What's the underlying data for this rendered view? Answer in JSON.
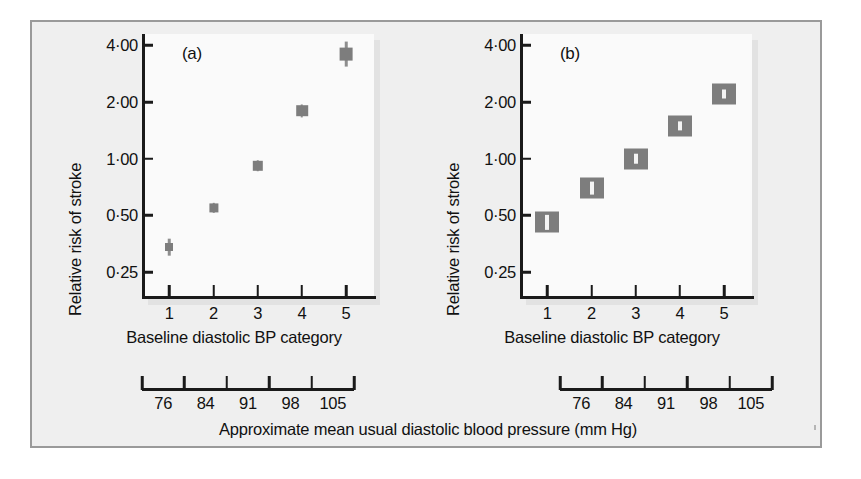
{
  "figure": {
    "caption": "Approximate mean usual diastolic blood pressure (mm Hg)",
    "frame_color": "#9a9a9a",
    "background": "#efefef",
    "marker_color": "#7d7d7d"
  },
  "panels": [
    {
      "tag": "(a)",
      "ylabel": "Relative risk of stroke",
      "xlabel": "Baseline diastolic BP category",
      "ytick_labels": [
        "4·00",
        "2·00",
        "1·00",
        "0·50",
        "0·25"
      ],
      "xtick_labels": [
        "1",
        "2",
        "3",
        "4",
        "5"
      ],
      "mmhg_labels": [
        "76",
        "84",
        "91",
        "98",
        "105"
      ]
    },
    {
      "tag": "(b)",
      "ylabel": "Relative risk of stroke",
      "xlabel": "Baseline  diastolic BP category",
      "ytick_labels": [
        "4·00",
        "2·00",
        "1·00",
        "0·50",
        "0·25"
      ],
      "xtick_labels": [
        "1",
        "2",
        "3",
        "4",
        "5"
      ],
      "mmhg_labels": [
        "76",
        "84",
        "91",
        "98",
        "105"
      ]
    }
  ],
  "chart_data": [
    {
      "type": "scatter",
      "title": "(a)",
      "xlabel": "Baseline diastolic BP category",
      "ylabel": "Relative risk of stroke",
      "yscale": "log",
      "ylim": [
        0.18,
        4.6
      ],
      "yticks": [
        4.0,
        2.0,
        1.0,
        0.5,
        0.25
      ],
      "ytick_labels": [
        "4·00",
        "2·00",
        "1·00",
        "0·50",
        "0·25"
      ],
      "categories": [
        "1",
        "2",
        "3",
        "4",
        "5"
      ],
      "x": [
        1,
        2,
        3,
        4,
        5
      ],
      "secondary_x": {
        "label": "Approximate mean usual diastolic blood pressure (mm Hg)",
        "tick_labels": [
          "76",
          "84",
          "91",
          "98",
          "105"
        ],
        "values": [
          76,
          84,
          91,
          98,
          105
        ]
      },
      "values": [
        0.34,
        0.55,
        0.92,
        1.8,
        3.6
      ],
      "ci_low": [
        0.31,
        0.52,
        0.86,
        1.66,
        3.1
      ],
      "ci_high": [
        0.38,
        0.59,
        0.99,
        1.95,
        4.2
      ],
      "grid": false,
      "legend": null
    },
    {
      "type": "scatter",
      "title": "(b)",
      "xlabel": "Baseline  diastolic BP category",
      "ylabel": "Relative risk of stroke",
      "yscale": "log",
      "ylim": [
        0.18,
        4.6
      ],
      "yticks": [
        4.0,
        2.0,
        1.0,
        0.5,
        0.25
      ],
      "ytick_labels": [
        "4·00",
        "2·00",
        "1·00",
        "0·50",
        "0·25"
      ],
      "categories": [
        "1",
        "2",
        "3",
        "4",
        "5"
      ],
      "x": [
        1,
        2,
        3,
        4,
        5
      ],
      "secondary_x": {
        "label": "Approximate mean usual diastolic blood pressure (mm Hg)",
        "tick_labels": [
          "76",
          "84",
          "91",
          "98",
          "105"
        ],
        "values": [
          76,
          84,
          91,
          98,
          105
        ]
      },
      "values": [
        0.46,
        0.7,
        1.0,
        1.5,
        2.2
      ],
      "ci_low": [
        0.42,
        0.65,
        0.94,
        1.42,
        2.1
      ],
      "ci_high": [
        0.5,
        0.76,
        1.07,
        1.59,
        2.3
      ],
      "grid": false,
      "legend": null
    }
  ]
}
